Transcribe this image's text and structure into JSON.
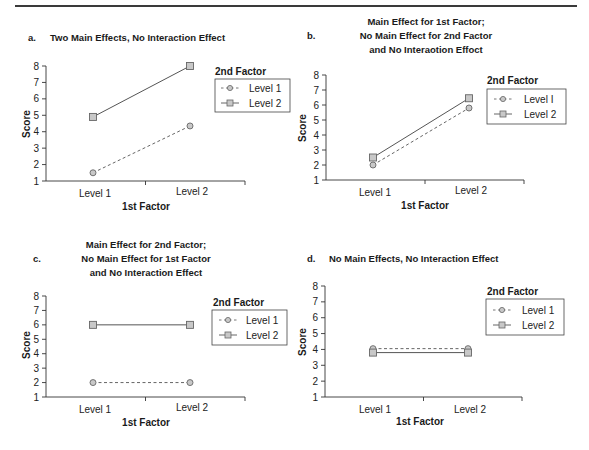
{
  "figure": {
    "panels": [
      {
        "id": "a",
        "letter": "a.",
        "title_lines": [
          "Two Main Effects, No Interaction Effect"
        ],
        "xlabel": "1st Factor",
        "ylabel": "Score"
      },
      {
        "id": "b",
        "letter": "b.",
        "title_lines": [
          "Main Effect for 1st Factor;",
          "No Main Effect for 2nd Factor",
          "and No Interaotion Effoct"
        ],
        "xlabel": "1st Factor",
        "ylabel": "Score"
      },
      {
        "id": "c",
        "letter": "c.",
        "title_lines": [
          "Main Effect for 2nd Factor;",
          "No Main Effect for 1st Factor",
          "and No Interaction Effect"
        ],
        "xlabel": "1st Factor",
        "ylabel": "Score"
      },
      {
        "id": "d",
        "letter": "d.",
        "title_lines": [
          "No Main Effects, No Interaction Effect"
        ],
        "xlabel": "1st Factor",
        "ylabel": "Score"
      }
    ],
    "legend": {
      "title": "2nd Factor",
      "entries": [
        "Level 1",
        "Level 2"
      ],
      "entries_b": [
        "Level I",
        "Level 2"
      ]
    },
    "colors": {
      "line": "#555555",
      "marker_fill": "#c8c8c8",
      "marker_stroke": "#666666",
      "axis": "#333333"
    }
  },
  "chart_data": [
    {
      "type": "line",
      "title": "a. Two Main Effects, No Interaction Effect",
      "xlabel": "1st Factor",
      "ylabel": "Score",
      "categories": [
        "Level 1",
        "Level 2"
      ],
      "yticks": [
        1,
        2,
        3,
        4,
        5,
        6,
        7,
        8
      ],
      "ylim": [
        1,
        8
      ],
      "grid": false,
      "legend_title": "2nd Factor",
      "legend_position": "right",
      "series": [
        {
          "name": "Level 1",
          "style": "dashed",
          "marker": "circle",
          "values": [
            1.5,
            4.35
          ]
        },
        {
          "name": "Level 2",
          "style": "solid",
          "marker": "square",
          "values": [
            4.9,
            8.0
          ]
        }
      ]
    },
    {
      "type": "line",
      "title": "b. Main Effect for 1st Factor; No Main Effect for 2nd Factor and No Interaction Effect",
      "xlabel": "1st Factor",
      "ylabel": "Score",
      "categories": [
        "Level 1",
        "Level 2"
      ],
      "yticks": [
        1,
        2,
        3,
        4,
        5,
        6,
        7,
        8
      ],
      "ylim": [
        1,
        8
      ],
      "grid": false,
      "legend_title": "2nd Factor",
      "legend_position": "right",
      "series": [
        {
          "name": "Level 1",
          "style": "dashed",
          "marker": "circle",
          "values": [
            2.0,
            5.8
          ]
        },
        {
          "name": "Level 2",
          "style": "solid",
          "marker": "square",
          "values": [
            2.5,
            6.45
          ]
        }
      ]
    },
    {
      "type": "line",
      "title": "c. Main Effect for 2nd Factor; No Main Effect for 1st Factor and No Interaction Effect",
      "xlabel": "1st Factor",
      "ylabel": "Score",
      "categories": [
        "Level 1",
        "Level 2"
      ],
      "yticks": [
        1,
        2,
        3,
        4,
        5,
        6,
        7,
        8
      ],
      "ylim": [
        1,
        8
      ],
      "grid": false,
      "legend_title": "2nd Factor",
      "legend_position": "right",
      "series": [
        {
          "name": "Level 1",
          "style": "dashed",
          "marker": "circle",
          "values": [
            2.0,
            2.0
          ]
        },
        {
          "name": "Level 2",
          "style": "solid",
          "marker": "square",
          "values": [
            6.0,
            6.0
          ]
        }
      ]
    },
    {
      "type": "line",
      "title": "d. No Main Effects, No Interaction Effect",
      "xlabel": "1st Factor",
      "ylabel": "Score",
      "categories": [
        "Level 1",
        "Level 2"
      ],
      "yticks": [
        1,
        2,
        3,
        4,
        5,
        6,
        7,
        8
      ],
      "ylim": [
        1,
        8
      ],
      "grid": false,
      "legend_title": "2nd Factor",
      "legend_position": "right",
      "series": [
        {
          "name": "Level 1",
          "style": "dashed",
          "marker": "circle",
          "values": [
            4.05,
            4.05
          ]
        },
        {
          "name": "Level 2",
          "style": "solid",
          "marker": "square",
          "values": [
            3.8,
            3.8
          ]
        }
      ]
    }
  ]
}
